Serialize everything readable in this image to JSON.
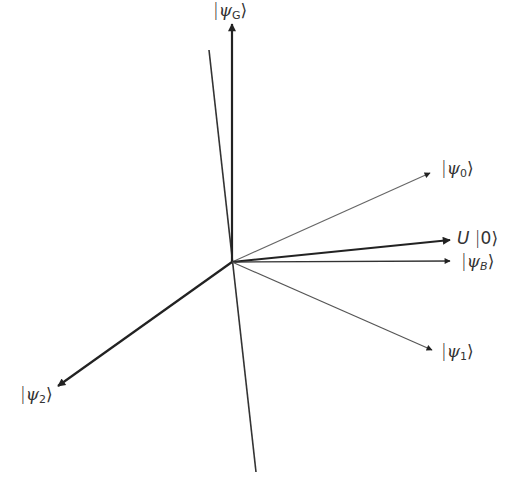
{
  "diagram": {
    "origin": {
      "x": 232,
      "y": 262
    },
    "colors": {
      "line": "#222222",
      "thin_line": "#555555",
      "background": "#ffffff"
    },
    "vectors": [
      {
        "id": "psi_G",
        "label": "|ψ_G⟩",
        "ket_symbol": "ψ",
        "subscript": "G",
        "end": {
          "x": 232,
          "y": 24
        }
      },
      {
        "id": "psi_0",
        "label": "|ψ_0⟩",
        "ket_symbol": "ψ",
        "subscript": "0",
        "end": {
          "x": 430,
          "y": 173
        }
      },
      {
        "id": "U0",
        "label": "U |0⟩",
        "operator": "U",
        "ket_value": "0",
        "end": {
          "x": 450,
          "y": 240
        }
      },
      {
        "id": "psi_B",
        "label": "|ψ_B⟩",
        "ket_symbol": "ψ",
        "subscript": "B",
        "end": {
          "x": 450,
          "y": 261
        }
      },
      {
        "id": "psi_1",
        "label": "|ψ_1⟩",
        "ket_symbol": "ψ",
        "subscript": "1",
        "end": {
          "x": 432,
          "y": 350
        }
      },
      {
        "id": "psi_2",
        "label": "|ψ_2⟩",
        "ket_symbol": "ψ",
        "subscript": "2",
        "end": {
          "x": 58,
          "y": 386
        }
      }
    ],
    "axis_line": {
      "start": {
        "x": 209,
        "y": 50
      },
      "end": {
        "x": 256,
        "y": 472
      }
    }
  },
  "labels": {
    "psi_G": {
      "bar": "|",
      "psi": "ψ",
      "sub": "G",
      "close": "⟩"
    },
    "psi_0": {
      "bar": "|",
      "psi": "ψ",
      "sub": "0",
      "close": "⟩"
    },
    "U0": {
      "op": "U",
      "bar": "|",
      "val": "0",
      "close": "⟩"
    },
    "psi_B": {
      "bar": "|",
      "psi": "ψ",
      "sub": "B",
      "close": "⟩"
    },
    "psi_1": {
      "bar": "|",
      "psi": "ψ",
      "sub": "1",
      "close": "⟩"
    },
    "psi_2": {
      "bar": "|",
      "psi": "ψ",
      "sub": "2",
      "close": "⟩"
    }
  }
}
